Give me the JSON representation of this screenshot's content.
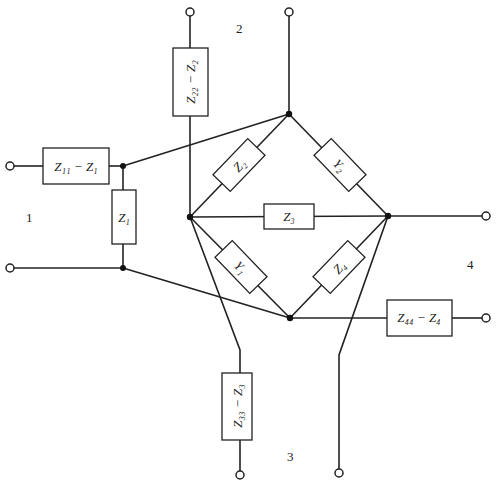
{
  "diagram": {
    "type": "equivalent-circuit",
    "ports": [
      {
        "id": "1",
        "label": "1"
      },
      {
        "id": "2",
        "label": "2"
      },
      {
        "id": "3",
        "label": "3"
      },
      {
        "id": "4",
        "label": "4"
      }
    ],
    "series_elements": {
      "z11": "Z₁₁ − Z₁",
      "z22": "Z₂₂ − Z₂",
      "z33": "Z₃₃ − Z₃",
      "z44": "Z₄₄ − Z₄"
    },
    "shunt_elements": {
      "z1": "Z₁"
    },
    "bridge_elements": {
      "z2": "Z₂",
      "y2": "Y₂",
      "z3": "Z₃",
      "y1": "Y₁",
      "z4": "Z₄"
    }
  }
}
